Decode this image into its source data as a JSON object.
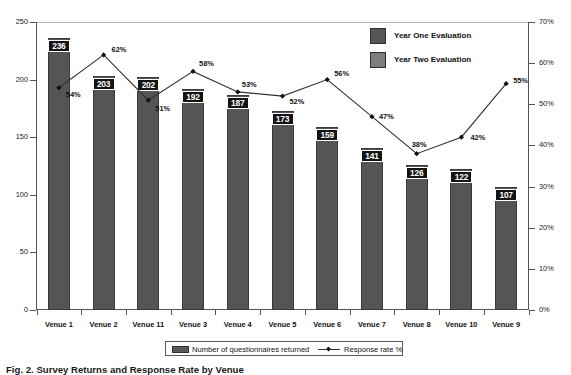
{
  "figure": {
    "caption": "Fig. 2. Survey Returns and Response Rate by Venue"
  },
  "chart_data": {
    "type": "bar",
    "title": "",
    "subtitle": "",
    "xlabel": "",
    "ylabel": "",
    "y2label": "",
    "grid": false,
    "categories": [
      "Venue 1",
      "Venue 2",
      "Venue 11",
      "Venue 3",
      "Venue 4",
      "Venue 5",
      "Venue 6",
      "Venue 7",
      "Venue 8",
      "Venue 10",
      "Venue 9"
    ],
    "series": [
      {
        "name": "Number of questionnaires returned",
        "type": "bar",
        "axis": "left",
        "color": "#555555",
        "values": [
          236,
          203,
          202,
          192,
          187,
          173,
          159,
          141,
          126,
          122,
          107
        ],
        "labels": [
          "236",
          "203",
          "202",
          "192",
          "187",
          "173",
          "159",
          "141",
          "126",
          "122",
          "107"
        ]
      },
      {
        "name": "Response rate %",
        "type": "line",
        "axis": "right",
        "color": "#333333",
        "values": [
          54,
          62,
          51,
          58,
          53,
          52,
          56,
          47,
          38,
          42,
          55
        ],
        "labels": [
          "54%",
          "62%",
          "51%",
          "58%",
          "53%",
          "52%",
          "56%",
          "47%",
          "38%",
          "42%",
          "55%"
        ]
      }
    ],
    "ylim": [
      0,
      250
    ],
    "yticks": [
      0,
      50,
      100,
      150,
      200,
      250
    ],
    "ytick_labels": [
      "0",
      "50",
      "100",
      "150",
      "200",
      "250"
    ],
    "y2lim": [
      0,
      70
    ],
    "y2ticks": [
      0,
      10,
      20,
      30,
      40,
      50,
      60,
      70
    ],
    "y2tick_labels": [
      "0%",
      "10%",
      "20%",
      "30%",
      "40%",
      "50%",
      "60%",
      "70%"
    ],
    "legend_position": "bottom",
    "legend_entries": [
      "Number of questionnaires returned",
      "Response rate %"
    ]
  },
  "inner_legend": {
    "position": "top-right",
    "items": [
      {
        "label": "Year One Evaluation",
        "color": "#555555"
      },
      {
        "label": "Year Two Evaluation",
        "color": "#7d7d7d"
      }
    ]
  }
}
